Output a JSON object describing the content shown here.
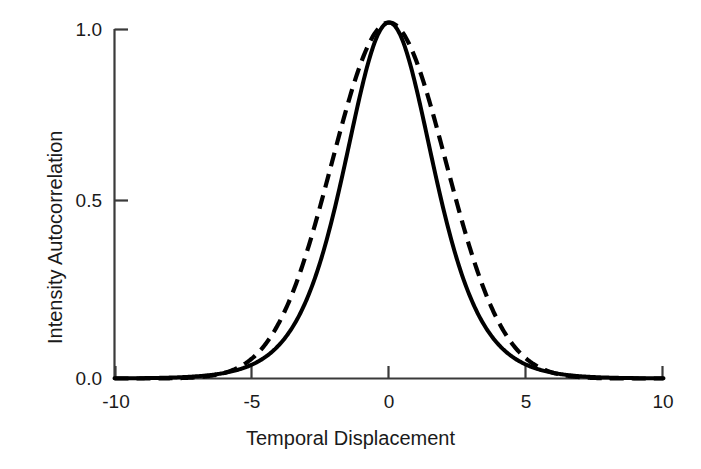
{
  "chart_data": {
    "type": "line",
    "title": "",
    "xlabel": "Temporal Displacement",
    "ylabel": "Intensity Autocorrelation",
    "xlim": [
      -10,
      10
    ],
    "ylim": [
      0.0,
      1.05
    ],
    "xticks": [
      -10,
      -5,
      0,
      5,
      10
    ],
    "xtick_labels": [
      "-10",
      "-5",
      "0",
      "5",
      "10"
    ],
    "yticks": [
      0.0,
      0.5,
      1.0
    ],
    "ytick_labels": [
      "0.0",
      "0.5",
      "1.0"
    ],
    "grid": false,
    "legend": "none",
    "peak_value": 1.02,
    "peak_position": 0,
    "fwhm": 4.9,
    "series": [
      {
        "name": "solid-curve",
        "style": "solid",
        "color": "#000000",
        "linewidth": 3.0,
        "model": "sech-squared",
        "x": [
          -10,
          -9.5,
          -9,
          -8.5,
          -8,
          -7.5,
          -7,
          -6.5,
          -6,
          -5.5,
          -5,
          -4.5,
          -4,
          -3.5,
          -3,
          -2.5,
          -2,
          -1.5,
          -1,
          -0.5,
          0,
          0.5,
          1,
          1.5,
          2,
          2.5,
          3,
          3.5,
          4,
          4.5,
          5,
          5.5,
          6,
          6.5,
          7,
          7.5,
          8,
          8.5,
          9,
          9.5,
          10
        ],
        "y": [
          0.005,
          0.007,
          0.01,
          0.014,
          0.019,
          0.026,
          0.036,
          0.049,
          0.067,
          0.091,
          0.123,
          0.165,
          0.218,
          0.285,
          0.365,
          0.457,
          0.557,
          0.659,
          0.777,
          0.9,
          1.02,
          0.9,
          0.777,
          0.659,
          0.557,
          0.457,
          0.365,
          0.285,
          0.218,
          0.165,
          0.123,
          0.091,
          0.067,
          0.049,
          0.036,
          0.026,
          0.019,
          0.014,
          0.01,
          0.007,
          0.005
        ]
      },
      {
        "name": "dashed-curve",
        "style": "dashed",
        "color": "#000000",
        "linewidth": 3.0,
        "model": "gaussian",
        "x": [
          -10,
          -9.5,
          -9,
          -8.5,
          -8,
          -7.5,
          -7,
          -6.5,
          -6,
          -5.5,
          -5,
          -4.5,
          -4,
          -3.5,
          -3,
          -2.5,
          -2,
          -1.5,
          -1,
          -0.5,
          0,
          0.5,
          1,
          1.5,
          2,
          2.5,
          3,
          3.5,
          4,
          4.5,
          5,
          5.5,
          6,
          6.5,
          7,
          7.5,
          8,
          8.5,
          9,
          9.5,
          10
        ],
        "y": [
          0.0,
          0.0,
          0.0,
          0.0,
          0.001,
          0.002,
          0.004,
          0.009,
          0.018,
          0.035,
          0.064,
          0.11,
          0.179,
          0.273,
          0.389,
          0.517,
          0.645,
          0.771,
          0.877,
          0.962,
          1.02,
          0.962,
          0.877,
          0.771,
          0.645,
          0.517,
          0.389,
          0.273,
          0.179,
          0.11,
          0.064,
          0.035,
          0.018,
          0.009,
          0.004,
          0.002,
          0.001,
          0.0,
          0.0,
          0.0,
          0.0
        ]
      }
    ]
  },
  "axis": {
    "y_title": "Intensity Autocorrelation",
    "x_title": "Temporal Displacement",
    "y_labels": [
      "1.0",
      "0.5",
      "0.0"
    ],
    "x_labels": [
      "-10",
      "-5",
      "0",
      "5",
      "10"
    ]
  }
}
